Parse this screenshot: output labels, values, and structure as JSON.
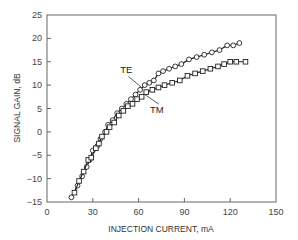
{
  "chart_data": {
    "type": "line",
    "title": "",
    "xlabel": "INJECTION CURRENT, mA",
    "ylabel": "SIGNAL GAIN, dB",
    "xlim": [
      0,
      150
    ],
    "ylim": [
      -15,
      25
    ],
    "xticks": [
      0,
      30,
      60,
      90,
      120,
      150
    ],
    "yticks": [
      -15,
      -10,
      -5,
      0,
      5,
      10,
      15,
      20,
      25
    ],
    "grid": false,
    "legend": "inline annotations",
    "annotations": [
      {
        "text": "TE",
        "x": 52,
        "y": 12.5,
        "arrow_to": [
          62,
          9.5
        ]
      },
      {
        "text": "TM",
        "x": 72,
        "y": 4,
        "arrow_to": [
          64,
          8
        ]
      }
    ],
    "series": [
      {
        "name": "TE",
        "marker": "circle",
        "points": [
          [
            16,
            -14
          ],
          [
            20,
            -11.5
          ],
          [
            23,
            -9.5
          ],
          [
            26,
            -7.5
          ],
          [
            28,
            -6
          ],
          [
            30,
            -4
          ],
          [
            33,
            -3
          ],
          [
            35,
            -1.5
          ],
          [
            38,
            0
          ],
          [
            40,
            1.5
          ],
          [
            43,
            2.5
          ],
          [
            46,
            4
          ],
          [
            49,
            5
          ],
          [
            52,
            6
          ],
          [
            55,
            7
          ],
          [
            58,
            8
          ],
          [
            61,
            9
          ],
          [
            64,
            10
          ],
          [
            67,
            10.5
          ],
          [
            70,
            11
          ],
          [
            73,
            12.5
          ],
          [
            76,
            13
          ],
          [
            80,
            13.5
          ],
          [
            84,
            14
          ],
          [
            88,
            14.5
          ],
          [
            93,
            15.5
          ],
          [
            98,
            16
          ],
          [
            103,
            16.5
          ],
          [
            108,
            17
          ],
          [
            113,
            17.5
          ],
          [
            118,
            18.5
          ],
          [
            122,
            18.5
          ],
          [
            126,
            19
          ]
        ]
      },
      {
        "name": "TM",
        "marker": "square",
        "points": [
          [
            18,
            -13
          ],
          [
            21,
            -10.5
          ],
          [
            24,
            -8.5
          ],
          [
            27,
            -6
          ],
          [
            29,
            -5.5
          ],
          [
            32,
            -3.5
          ],
          [
            34,
            -2.5
          ],
          [
            36,
            -1
          ],
          [
            39,
            0
          ],
          [
            41,
            1
          ],
          [
            44,
            2
          ],
          [
            47,
            3.5
          ],
          [
            50,
            4.5
          ],
          [
            53,
            5.5
          ],
          [
            56,
            6
          ],
          [
            59,
            7
          ],
          [
            62,
            7.5
          ],
          [
            65,
            8.5
          ],
          [
            69,
            9
          ],
          [
            73,
            9.5
          ],
          [
            77,
            10
          ],
          [
            82,
            10.5
          ],
          [
            87,
            11
          ],
          [
            92,
            12
          ],
          [
            97,
            12.5
          ],
          [
            102,
            13
          ],
          [
            107,
            13.5
          ],
          [
            112,
            14
          ],
          [
            116,
            14.5
          ],
          [
            120,
            15
          ],
          [
            124,
            15
          ],
          [
            130,
            15
          ]
        ]
      }
    ]
  },
  "labels": {
    "te": "TE",
    "tm": "TM",
    "xlabel": "INJECTION CURRENT, mA",
    "ylabel": "SIGNAL GAIN, dB"
  }
}
